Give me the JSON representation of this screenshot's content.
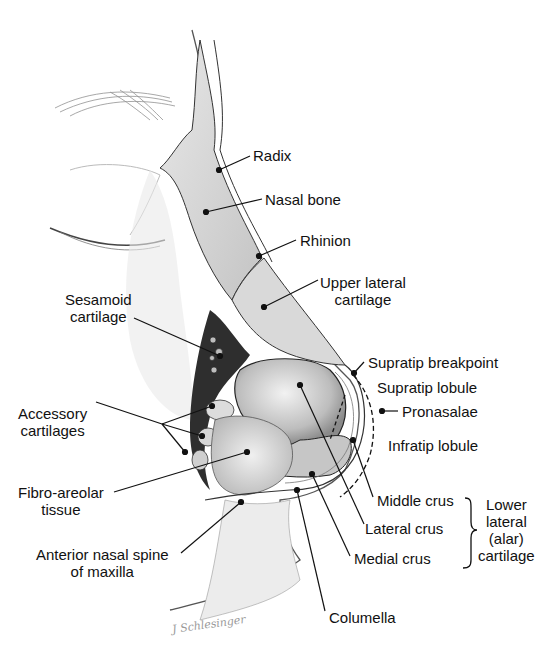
{
  "figure": {
    "signature": "J Schlesinger",
    "labels": {
      "radix": "Radix",
      "nasal_bone": "Nasal bone",
      "rhinion": "Rhinion",
      "upper_lateral_cartilage": [
        "Upper lateral",
        "cartilage"
      ],
      "sesamoid_cartilage": [
        "Sesamoid",
        "cartilage"
      ],
      "supratip_breakpoint": "Supratip breakpoint",
      "supratip_lobule": "Supratip lobule",
      "pronasalae": "Pronasalae",
      "infratip_lobule": "Infratip lobule",
      "accessory_cartilages": [
        "Accessory",
        "cartilages"
      ],
      "fibro_areolar_tissue": [
        "Fibro-areolar",
        "tissue"
      ],
      "middle_crus": "Middle crus",
      "lateral_crus": "Lateral crus",
      "medial_crus": "Medial crus",
      "lower_lateral_cartilage": [
        "Lower",
        "lateral",
        "(alar)",
        "cartilage"
      ],
      "anterior_nasal_spine": [
        "Anterior nasal spine",
        "of maxilla"
      ],
      "columella": "Columella"
    },
    "colors": {
      "ink": "#111111",
      "bone": "#d4d4d4",
      "cartilage": "#c8c8c8",
      "shadow": "#3a3a3a",
      "skin": "#efefef"
    }
  }
}
